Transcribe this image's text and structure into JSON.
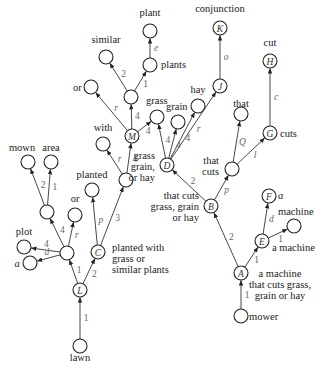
{
  "diagram": {
    "type": "semantic tree / dependency graph",
    "nodes": [
      {
        "key": "lawn_root",
        "x": 240,
        "y": 345,
        "id": "",
        "label": "lawn",
        "label_x": 232,
        "label_y": 358,
        "anchor": "middle",
        "lx": 240,
        "ly": 359
      },
      {
        "key": "L",
        "x": 80,
        "y": 290,
        "id": "L"
      },
      {
        "key": "lawn",
        "x": 80,
        "y": 346,
        "id": "",
        "label": "lawn"
      },
      {
        "key": "n_left",
        "x": 67,
        "y": 253,
        "id": ""
      },
      {
        "key": "C",
        "x": 98,
        "y": 252,
        "id": "C"
      },
      {
        "key": "plot",
        "x": 24,
        "y": 247,
        "id": ""
      },
      {
        "key": "a_left",
        "x": 30,
        "y": 263,
        "id": ""
      },
      {
        "key": "n_mown_par",
        "x": 47,
        "y": 212,
        "id": ""
      },
      {
        "key": "or_left",
        "x": 75,
        "y": 215,
        "id": ""
      },
      {
        "key": "mown",
        "x": 28,
        "y": 162,
        "id": ""
      },
      {
        "key": "area",
        "x": 51,
        "y": 162,
        "id": ""
      },
      {
        "key": "planted",
        "x": 92,
        "y": 190,
        "id": ""
      },
      {
        "key": "n_mid",
        "x": 126,
        "y": 180,
        "id": ""
      },
      {
        "key": "with",
        "x": 103,
        "y": 144,
        "id": ""
      },
      {
        "key": "M",
        "x": 132,
        "y": 136,
        "id": "M"
      },
      {
        "key": "or_top",
        "x": 91,
        "y": 87,
        "id": ""
      },
      {
        "key": "n_mm",
        "x": 131,
        "y": 97,
        "id": ""
      },
      {
        "key": "similar",
        "x": 106,
        "y": 57,
        "id": ""
      },
      {
        "key": "plants",
        "x": 150,
        "y": 65,
        "id": ""
      },
      {
        "key": "plant",
        "x": 150,
        "y": 31,
        "id": ""
      },
      {
        "key": "grass",
        "x": 157,
        "y": 117,
        "id": ""
      },
      {
        "key": "D",
        "x": 167,
        "y": 165,
        "id": "D"
      },
      {
        "key": "grain",
        "x": 178,
        "y": 122,
        "id": ""
      },
      {
        "key": "hay",
        "x": 198,
        "y": 106,
        "id": ""
      },
      {
        "key": "J",
        "x": 220,
        "y": 86,
        "id": "J"
      },
      {
        "key": "K",
        "x": 220,
        "y": 28,
        "id": "K"
      },
      {
        "key": "B",
        "x": 211,
        "y": 206,
        "id": "B"
      },
      {
        "key": "that_cuts",
        "x": 232,
        "y": 169,
        "id": ""
      },
      {
        "key": "that",
        "x": 241,
        "y": 114,
        "id": ""
      },
      {
        "key": "G",
        "x": 270,
        "y": 133,
        "id": "G"
      },
      {
        "key": "H",
        "x": 270,
        "y": 61,
        "id": "H"
      },
      {
        "key": "A",
        "x": 241,
        "y": 273,
        "id": "A"
      },
      {
        "key": "E",
        "x": 262,
        "y": 241,
        "id": "E"
      },
      {
        "key": "F",
        "x": 269,
        "y": 196,
        "id": "F"
      },
      {
        "key": "machine",
        "x": 294,
        "y": 226,
        "id": ""
      },
      {
        "key": "mower",
        "x": 241,
        "y": 316,
        "id": ""
      }
    ],
    "edges": [
      {
        "from": "lawn",
        "to": "L",
        "label": "1",
        "italic": false
      },
      {
        "from": "L",
        "to": "n_left",
        "label": "1",
        "italic": false
      },
      {
        "from": "L",
        "to": "C",
        "label": "2",
        "italic": false
      },
      {
        "from": "n_left",
        "to": "plot",
        "label": "4",
        "italic": false
      },
      {
        "from": "n_left",
        "to": "a_left",
        "label": "d",
        "italic": true
      },
      {
        "from": "n_left",
        "to": "n_mown_par",
        "label": "4",
        "italic": false
      },
      {
        "from": "n_left",
        "to": "or_left",
        "label": "r",
        "italic": true
      },
      {
        "from": "n_mown_par",
        "to": "mown",
        "label": "2",
        "italic": false
      },
      {
        "from": "n_mown_par",
        "to": "area",
        "label": "1",
        "italic": false
      },
      {
        "from": "C",
        "to": "planted",
        "label": "p",
        "italic": true
      },
      {
        "from": "C",
        "to": "n_mid",
        "label": "3",
        "italic": false
      },
      {
        "from": "n_mid",
        "to": "with",
        "label": "r",
        "italic": true
      },
      {
        "from": "n_mid",
        "to": "M",
        "label": "4",
        "italic": false
      },
      {
        "from": "M",
        "to": "or_top",
        "label": "r",
        "italic": true
      },
      {
        "from": "M",
        "to": "n_mm",
        "label": "4",
        "italic": false
      },
      {
        "from": "M",
        "to": "grass",
        "label": "4",
        "italic": false
      },
      {
        "from": "n_mm",
        "to": "similar",
        "label": "2",
        "italic": false
      },
      {
        "from": "n_mm",
        "to": "plants",
        "label": "1",
        "italic": false
      },
      {
        "from": "plants",
        "to": "plant",
        "label": "e",
        "italic": true
      },
      {
        "from": "D",
        "to": "grass",
        "label": "4",
        "italic": false
      },
      {
        "from": "D",
        "to": "grain",
        "label": "4",
        "italic": false
      },
      {
        "from": "D",
        "to": "hay",
        "label": "4",
        "italic": false
      },
      {
        "from": "D",
        "to": "J",
        "label": "r",
        "italic": true
      },
      {
        "from": "J",
        "to": "K",
        "label": "o",
        "italic": true
      },
      {
        "from": "B",
        "to": "D",
        "label": "2",
        "italic": false
      },
      {
        "from": "B",
        "to": "that_cuts",
        "label": "p",
        "italic": true
      },
      {
        "from": "that_cuts",
        "to": "that",
        "label": "Q",
        "italic": true
      },
      {
        "from": "that_cuts",
        "to": "G",
        "label": "l",
        "italic": true
      },
      {
        "from": "G",
        "to": "H",
        "label": "c",
        "italic": true
      },
      {
        "from": "A",
        "to": "B",
        "label": "2",
        "italic": false
      },
      {
        "from": "A",
        "to": "E",
        "label": "1",
        "italic": false
      },
      {
        "from": "E",
        "to": "F",
        "label": "d",
        "italic": true
      },
      {
        "from": "E",
        "to": "machine",
        "label": "1",
        "italic": false
      },
      {
        "from": "mower",
        "to": "A",
        "label": "1",
        "italic": false
      }
    ],
    "texts": {
      "conjunction": "conjunction",
      "cut": "cut",
      "plant": "plant",
      "similar": "similar",
      "plants": "plants",
      "or_top": "or",
      "grass": "grass",
      "hay": "hay",
      "grain": "grain",
      "that": "that",
      "with": "with",
      "mown": "mown",
      "area": "area",
      "planted": "planted",
      "or_left": "or",
      "plot": "plot",
      "a_left": "a",
      "cuts": "cuts",
      "that_cuts_1": "that",
      "that_cuts_2": "cuts",
      "D_1": "grass",
      "D_2": "grain,",
      "D_3": "or hay",
      "B_1": "that cuts",
      "B_2": "grass, grain",
      "B_3": "or hay",
      "C_1": "planted with",
      "C_2": "grass or",
      "C_3": "similar plants",
      "F_a": "a",
      "machine": "machine",
      "E_lbl": "a machine",
      "A_1": "a machine",
      "A_2": "that cuts grass,",
      "A_3": "grain or hay",
      "mower": "mower",
      "lawn": "lawn"
    }
  }
}
